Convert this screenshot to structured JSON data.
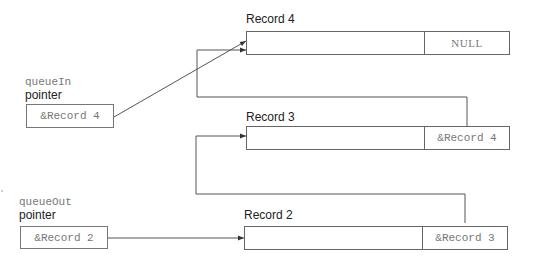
{
  "diagram": {
    "type": "linked-list-queue",
    "pointers": [
      {
        "id": "queueIn",
        "name": "queueIn",
        "caption": "pointer",
        "value": "&Record 4",
        "points_to": "record4"
      },
      {
        "id": "queueOut",
        "name": "queueOut",
        "caption": "pointer",
        "value": "&Record 2",
        "points_to": "record2"
      }
    ],
    "records": [
      {
        "id": "record4",
        "title": "Record 4",
        "data": "",
        "next": "NULL"
      },
      {
        "id": "record3",
        "title": "Record 3",
        "data": "",
        "next": "&Record 4"
      },
      {
        "id": "record2",
        "title": "Record 2",
        "data": "",
        "next": "&Record 3"
      }
    ],
    "links": [
      {
        "from": "queueIn.pointer",
        "to": "record4"
      },
      {
        "from": "queueOut.pointer",
        "to": "record2"
      },
      {
        "from": "record3.next",
        "to": "record4"
      },
      {
        "from": "record2.next",
        "to": "record3"
      }
    ],
    "colors": {
      "line": "#555555",
      "box_border": "#666666",
      "mono_text": "#777777",
      "label_text": "#222222"
    }
  }
}
